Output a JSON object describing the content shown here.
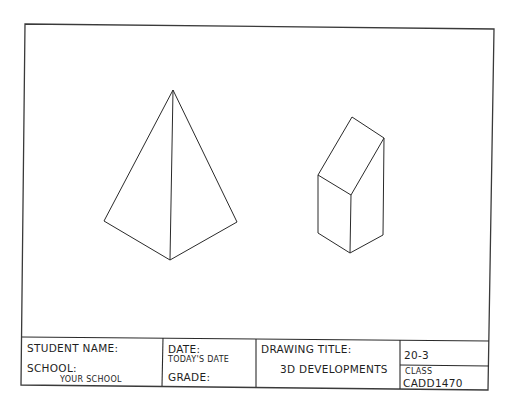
{
  "sheet": {
    "border_color": "#3a3a3a",
    "line_color": "#2a2a2a",
    "background": "#ffffff"
  },
  "drawing": {
    "objects": [
      {
        "name": "triangular-pyramid",
        "type": "isometric-pyramid",
        "vertices": {
          "apex": [
            173,
            90
          ],
          "left": [
            104,
            221
          ],
          "front": [
            170,
            260
          ],
          "right": [
            237,
            222
          ]
        }
      },
      {
        "name": "truncated-prism",
        "type": "isometric-prism-slanted-top",
        "vertices": {
          "top_back": [
            352,
            117
          ],
          "top_right": [
            384,
            138
          ],
          "left_top": [
            318,
            175
          ],
          "front_top": [
            351,
            195
          ],
          "left_bottom": [
            318,
            233
          ],
          "front_bottom": [
            350,
            253
          ],
          "right_bottom": [
            383,
            235
          ]
        }
      }
    ]
  },
  "title_block": {
    "student_name_label": "STUDENT NAME:",
    "school_label": "SCHOOL:",
    "school_value": "YOUR SCHOOL",
    "date_label": "DATE:",
    "date_value": "TODAY'S DATE",
    "grade_label": "GRADE:",
    "drawing_title_label": "DRAWING TITLE:",
    "drawing_title_value": "3D DEVELOPMENTS",
    "drawing_number": "20-3",
    "class_label": "CLASS",
    "class_value": "CADD1470"
  }
}
